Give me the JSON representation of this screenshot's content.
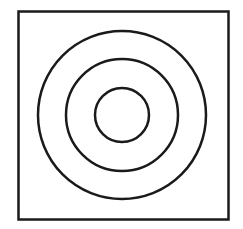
{
  "diagram": {
    "type": "concentric-circles-in-square",
    "stroke_color": "#1a1a1a",
    "background": "#ffffff",
    "square": {
      "x": 18.5,
      "y": 11.5,
      "width": 210,
      "height": 208,
      "stroke_width": 2.5
    },
    "center": {
      "x": 122,
      "y": 115
    },
    "circles": [
      {
        "name": "outer",
        "r": 84,
        "stroke_width": 2.5
      },
      {
        "name": "middle",
        "r": 56,
        "stroke_width": 2.5
      },
      {
        "name": "inner",
        "r": 27,
        "stroke_width": 2.5
      }
    ]
  }
}
